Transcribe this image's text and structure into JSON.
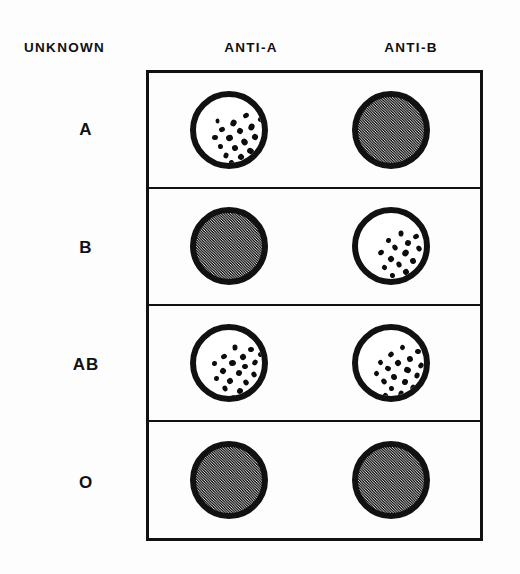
{
  "figure": {
    "background_color": "#fdfdfd",
    "ink_color": "#111111",
    "negative_fill_color": "#9a9a9a",
    "clump_color": "#0d0d0d"
  },
  "headers": {
    "unknown": "UNKNOWN",
    "anti_a": "ANTI-A",
    "anti_b": "ANTI-B"
  },
  "rows": [
    {
      "label": "A",
      "anti_a": {
        "state": "agglutinated",
        "clump_count": 21
      },
      "anti_b": {
        "state": "not-agglutinated",
        "clump_count": 0
      }
    },
    {
      "label": "B",
      "anti_a": {
        "state": "not-agglutinated",
        "clump_count": 0
      },
      "anti_b": {
        "state": "agglutinated",
        "clump_count": 19
      }
    },
    {
      "label": "AB",
      "anti_a": {
        "state": "agglutinated",
        "clump_count": 22
      },
      "anti_b": {
        "state": "agglutinated",
        "clump_count": 22
      }
    },
    {
      "label": "O",
      "anti_a": {
        "state": "not-agglutinated",
        "clump_count": 0
      },
      "anti_b": {
        "state": "not-agglutinated",
        "clump_count": 0
      }
    }
  ],
  "chart_data": {
    "type": "table",
    "columns": [
      "UNKNOWN",
      "ANTI-A",
      "ANTI-B"
    ],
    "rows": [
      [
        "A",
        "agglutinated",
        "not-agglutinated"
      ],
      [
        "B",
        "not-agglutinated",
        "agglutinated"
      ],
      [
        "AB",
        "agglutinated",
        "agglutinated"
      ],
      [
        "O",
        "not-agglutinated",
        "not-agglutinated"
      ]
    ],
    "legend": [
      "agglutinated = white well with dark clumps",
      "not-agglutinated = uniform stippled grey well"
    ],
    "grid": true,
    "legend_position": "none"
  },
  "clump_maps": {
    "a_anti_a": [
      [
        47,
        16,
        6,
        5
      ],
      [
        62,
        20,
        5,
        5
      ],
      [
        34,
        23,
        7,
        6
      ],
      [
        23,
        30,
        6,
        5
      ],
      [
        52,
        27,
        7,
        6
      ],
      [
        41,
        31,
        6,
        6
      ],
      [
        68,
        30,
        5,
        5
      ],
      [
        16,
        38,
        6,
        5
      ],
      [
        30,
        38,
        7,
        6
      ],
      [
        56,
        37,
        6,
        6
      ],
      [
        45,
        42,
        7,
        6
      ],
      [
        22,
        47,
        5,
        5
      ],
      [
        63,
        44,
        6,
        5
      ],
      [
        36,
        48,
        6,
        6
      ],
      [
        51,
        51,
        7,
        6
      ],
      [
        27,
        56,
        6,
        5
      ],
      [
        42,
        57,
        6,
        6
      ],
      [
        58,
        57,
        5,
        5
      ],
      [
        33,
        63,
        5,
        5
      ],
      [
        49,
        65,
        6,
        5
      ],
      [
        19,
        22,
        5,
        4
      ]
    ],
    "b_anti_b": [
      [
        40,
        18,
        6,
        5
      ],
      [
        55,
        21,
        6,
        5
      ],
      [
        28,
        25,
        5,
        5
      ],
      [
        66,
        26,
        5,
        5
      ],
      [
        47,
        27,
        6,
        6
      ],
      [
        34,
        32,
        6,
        5
      ],
      [
        58,
        33,
        6,
        5
      ],
      [
        20,
        37,
        6,
        5
      ],
      [
        44,
        37,
        7,
        6
      ],
      [
        30,
        43,
        6,
        6
      ],
      [
        65,
        40,
        5,
        5
      ],
      [
        52,
        45,
        6,
        6
      ],
      [
        38,
        49,
        6,
        5
      ],
      [
        24,
        52,
        5,
        5
      ],
      [
        60,
        52,
        6,
        5
      ],
      [
        45,
        56,
        6,
        6
      ],
      [
        32,
        60,
        5,
        5
      ],
      [
        54,
        62,
        6,
        5
      ],
      [
        41,
        66,
        5,
        5
      ]
    ],
    "ab_anti_a": [
      [
        36,
        15,
        6,
        5
      ],
      [
        52,
        17,
        6,
        5
      ],
      [
        25,
        24,
        6,
        5
      ],
      [
        62,
        22,
        5,
        5
      ],
      [
        44,
        24,
        6,
        6
      ],
      [
        16,
        31,
        5,
        5
      ],
      [
        33,
        30,
        7,
        6
      ],
      [
        56,
        30,
        6,
        5
      ],
      [
        46,
        34,
        6,
        5
      ],
      [
        24,
        38,
        6,
        6
      ],
      [
        40,
        40,
        6,
        6
      ],
      [
        66,
        37,
        5,
        5
      ],
      [
        55,
        42,
        6,
        5
      ],
      [
        18,
        46,
        5,
        5
      ],
      [
        31,
        48,
        6,
        6
      ],
      [
        47,
        50,
        6,
        5
      ],
      [
        61,
        50,
        5,
        5
      ],
      [
        26,
        56,
        6,
        5
      ],
      [
        41,
        58,
        6,
        6
      ],
      [
        55,
        60,
        5,
        5
      ],
      [
        35,
        65,
        5,
        5
      ],
      [
        49,
        67,
        5,
        4
      ]
    ],
    "ab_anti_b": [
      [
        42,
        15,
        5,
        5
      ],
      [
        57,
        19,
        6,
        5
      ],
      [
        30,
        22,
        6,
        5
      ],
      [
        66,
        25,
        5,
        5
      ],
      [
        49,
        26,
        6,
        6
      ],
      [
        20,
        30,
        5,
        5
      ],
      [
        37,
        30,
        6,
        6
      ],
      [
        60,
        33,
        6,
        5
      ],
      [
        27,
        36,
        6,
        5
      ],
      [
        46,
        37,
        7,
        6
      ],
      [
        16,
        41,
        5,
        5
      ],
      [
        56,
        43,
        6,
        5
      ],
      [
        33,
        44,
        6,
        6
      ],
      [
        65,
        45,
        5,
        5
      ],
      [
        23,
        49,
        6,
        5
      ],
      [
        44,
        49,
        6,
        6
      ],
      [
        52,
        55,
        6,
        5
      ],
      [
        31,
        56,
        5,
        5
      ],
      [
        63,
        57,
        5,
        4
      ],
      [
        40,
        61,
        6,
        5
      ],
      [
        25,
        63,
        5,
        5
      ],
      [
        50,
        66,
        6,
        5
      ]
    ]
  }
}
